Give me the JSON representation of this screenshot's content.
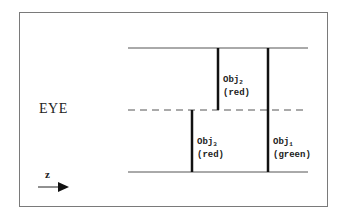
{
  "diagram": {
    "eye_label": "EYE",
    "axis_label": "z",
    "objects": [
      {
        "id": "obj2",
        "name": "Obj",
        "subscript": "2",
        "color_label": "(red)"
      },
      {
        "id": "obj3",
        "name": "Obj",
        "subscript": "3",
        "color_label": "(red)"
      },
      {
        "id": "obj1",
        "name": "Obj",
        "subscript": "1",
        "color_label": "(green)"
      }
    ]
  }
}
